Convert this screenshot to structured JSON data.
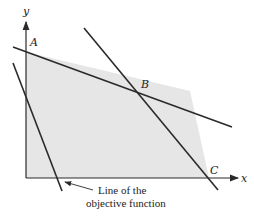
{
  "diagram": {
    "type": "linear-programming-feasible-region",
    "axes": {
      "x_label": "x",
      "y_label": "y"
    },
    "vertices": [
      {
        "label": "A",
        "role": "y-intercept vertex"
      },
      {
        "label": "B",
        "role": "intersection of constraint lines"
      },
      {
        "label": "C",
        "role": "x-intercept vertex"
      }
    ],
    "annotation": {
      "line1": "Line of the",
      "line2": "objective function"
    },
    "colors": {
      "region_fill": "#e6e6e6",
      "line": "#2a2a2a",
      "background": "#ffffff"
    }
  }
}
